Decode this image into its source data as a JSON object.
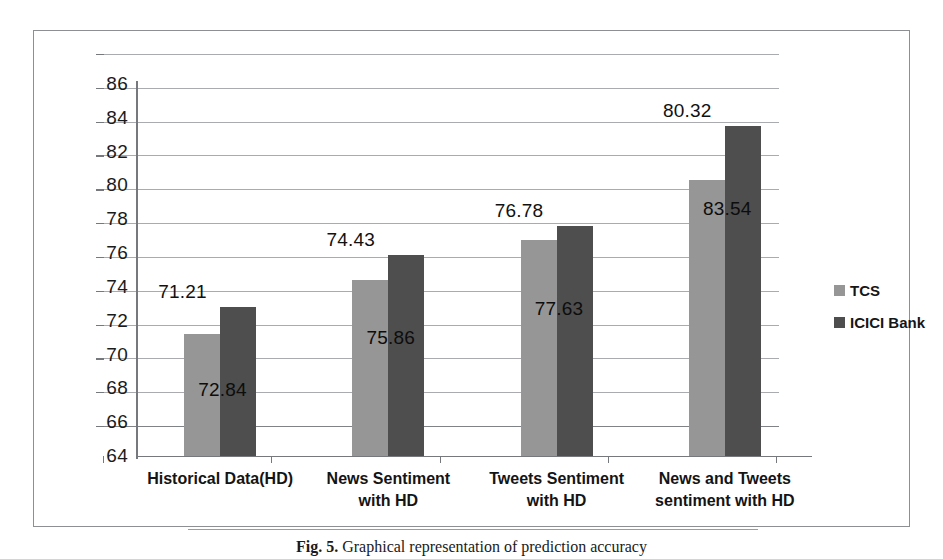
{
  "chart_data": {
    "type": "bar",
    "title": "",
    "xlabel": "",
    "ylabel": "",
    "ylim": [
      64,
      86
    ],
    "ytick_step": 2,
    "yticks": [
      86,
      84,
      82,
      80,
      78,
      76,
      74,
      72,
      70,
      68,
      66,
      64
    ],
    "grid": true,
    "legend_position": "right",
    "categories": [
      "Historical Data(HD)",
      "News Sentiment with HD",
      "Tweets Sentiment with HD",
      "News and Tweets sentiment with HD"
    ],
    "category_lines": [
      [
        "Historical Data(HD)"
      ],
      [
        "News Sentiment",
        "with HD"
      ],
      [
        "Tweets Sentiment",
        "with HD"
      ],
      [
        "News and Tweets",
        "sentiment with HD"
      ]
    ],
    "series": [
      {
        "name": "TCS",
        "color": "#969696",
        "values": [
          71.21,
          74.43,
          76.78,
          80.32
        ],
        "labels": [
          "71.21",
          "74.43",
          "76.78",
          "80.32"
        ]
      },
      {
        "name": "ICICI Bank",
        "color": "#4e4e4e",
        "values": [
          72.84,
          75.86,
          77.63,
          83.54
        ],
        "labels": [
          "72.84",
          "75.86",
          "77.63",
          "83.54"
        ]
      }
    ]
  },
  "legend": {
    "items": [
      {
        "label": "TCS",
        "color": "#969696"
      },
      {
        "label": "ICICI Bank",
        "color": "#4e4e4e"
      }
    ]
  },
  "caption": {
    "figure_number": "Fig. 5.",
    "text": "Graphical representation of prediction accuracy"
  }
}
